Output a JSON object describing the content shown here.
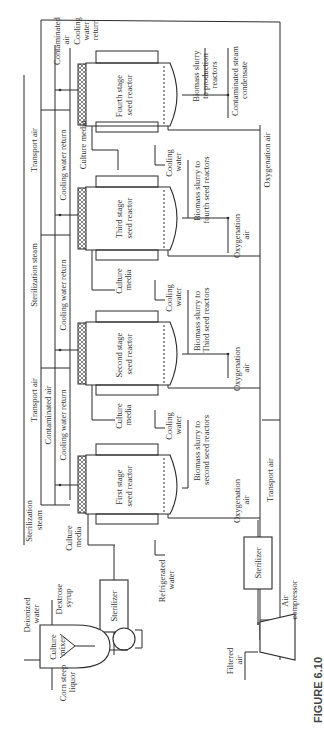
{
  "figure": {
    "caption": "FIGURE 6.10",
    "orientation": "rotated 90 degrees counter-clockwise"
  },
  "reactors": [
    {
      "label_line1": "Fourth stage",
      "label_line2": "seed reactor"
    },
    {
      "label_line1": "Third stage",
      "label_line2": "seed reactor"
    },
    {
      "label_line1": "Second stage",
      "label_line2": "seed reactor"
    },
    {
      "label_line1": "First stage",
      "label_line2": "seed reactor"
    }
  ],
  "headers": {
    "transport_air_top": "Transport air",
    "sterilization_steam_mid": "Sterilization steam",
    "transport_air_mid": "Transport air",
    "contaminated_air_mid": "Contaminated air",
    "cooling_water_return_1": "Cooling water return",
    "cooling_water_return_2": "Cooling water return",
    "cooling_water_return_3": "Cooling water return",
    "contaminated_air_top_1": "Contaminated",
    "contaminated_air_top_2": "air",
    "cooling_water_return_top_1": "Cooling",
    "cooling_water_return_top_2": "water",
    "cooling_water_return_top_3": "return",
    "sterilization_steam_bottom_1": "Sterilization",
    "sterilization_steam_bottom_2": "steam"
  },
  "streams": {
    "culture_media": "Culture media",
    "culture_media_1": "Culture",
    "culture_media_2": "media",
    "cooling_water_1": "Cooling",
    "cooling_water_2": "water",
    "biomass_prod_1": "Biomass slurry",
    "biomass_prod_2": "to production",
    "biomass_prod_3": "reactors",
    "condensate_1": "Contaminated steam",
    "condensate_2": "condensate",
    "biomass_fourth_1": "Biomass slurry to",
    "biomass_fourth_2": "fourth seed reactors",
    "biomass_third_1": "Biomass slurry to",
    "biomass_third_2": "Third seed reactors",
    "biomass_second_1": "Biomass slurry to",
    "biomass_second_2": "second seed reactors",
    "oxygenation_air": "Oxygenation air",
    "oxygenation_air_1": "Oxygenation",
    "oxygenation_air_2": "air",
    "transport_air_bottom": "Transport air",
    "refrigerated_water_1": "Refrigerated",
    "refrigerated_water_2": "water"
  },
  "equipment": {
    "sterilizer_media": "Sterilizer",
    "sterilizer_air": "Sterilizer",
    "culture_mixer_1": "Culture",
    "culture_mixer_2": "mixer",
    "air_compressor_1": "Air",
    "air_compressor_2": "compressor"
  },
  "feeds": {
    "deionized_water_1": "Deionized",
    "deionized_water_2": "water",
    "dextrose_syrup_1": "Dextrose",
    "dextrose_syrup_2": "syrup",
    "corn_steep_liquor_1": "Corn steep",
    "corn_steep_liquor_2": "liquor",
    "filtered_air_1": "Filtered",
    "filtered_air_2": "air"
  }
}
